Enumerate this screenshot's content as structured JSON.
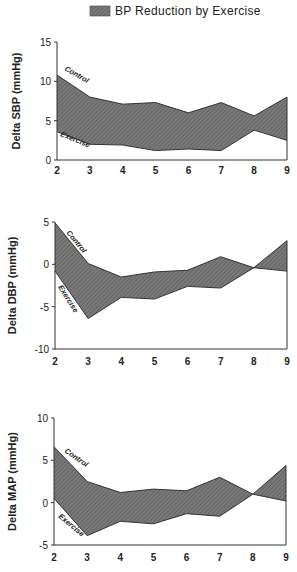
{
  "legend": {
    "label": "BP Reduction by Exercise",
    "fill_color": "#6e6e6e"
  },
  "chart_data": [
    {
      "type": "area",
      "title": "",
      "ylabel": "Delta SBP (mmHg)",
      "xlabel": "",
      "x": [
        2,
        3,
        4,
        5,
        6,
        7,
        8,
        9
      ],
      "ylim": [
        0,
        15
      ],
      "yticks": [
        0,
        5,
        10,
        15
      ],
      "grid": false,
      "series": [
        {
          "name": "Control",
          "values": [
            10.8,
            8.0,
            7.1,
            7.3,
            6.0,
            7.3,
            5.6,
            8.0
          ]
        },
        {
          "name": "Exercise",
          "values": [
            3.6,
            2.0,
            1.9,
            1.2,
            1.4,
            1.2,
            3.8,
            2.5
          ]
        }
      ],
      "shaded_between": "BP Reduction by Exercise",
      "legend_position": "top"
    },
    {
      "type": "area",
      "title": "",
      "ylabel": "Delta DBP (mmHg)",
      "xlabel": "",
      "x": [
        2,
        3,
        4,
        5,
        6,
        7,
        8,
        9
      ],
      "ylim": [
        -10,
        5
      ],
      "yticks": [
        -10,
        -5,
        0,
        5
      ],
      "grid": false,
      "series": [
        {
          "name": "Control",
          "values": [
            4.9,
            0.1,
            -1.5,
            -0.9,
            -0.7,
            0.9,
            -0.4,
            2.8
          ]
        },
        {
          "name": "Exercise",
          "values": [
            -0.8,
            -6.4,
            -3.9,
            -4.1,
            -2.6,
            -2.8,
            -0.4,
            -0.8
          ]
        }
      ],
      "shaded_between": "BP Reduction by Exercise"
    },
    {
      "type": "area",
      "title": "",
      "ylabel": "Delta MAP (mmHg)",
      "xlabel": "",
      "x": [
        2,
        3,
        4,
        5,
        6,
        7,
        8,
        9
      ],
      "ylim": [
        -5,
        10
      ],
      "yticks": [
        -5,
        0,
        5,
        10
      ],
      "grid": false,
      "series": [
        {
          "name": "Control",
          "values": [
            6.6,
            2.5,
            1.2,
            1.6,
            1.4,
            3.0,
            1.0,
            4.4
          ]
        },
        {
          "name": "Exercise",
          "values": [
            0.5,
            -3.9,
            -2.2,
            -2.5,
            -1.3,
            -1.6,
            1.0,
            0.2
          ]
        }
      ],
      "shaded_between": "BP Reduction by Exercise"
    }
  ],
  "panels": [
    {
      "ylabel": "Delta SBP (mmHg)",
      "control_label": "Control",
      "exercise_label": "Exercise"
    },
    {
      "ylabel": "Delta DBP (mmHg)",
      "control_label": "Control",
      "exercise_label": "Exercise"
    },
    {
      "ylabel": "Delta MAP (mmHg)",
      "control_label": "Control",
      "exercise_label": "Exercise"
    }
  ]
}
